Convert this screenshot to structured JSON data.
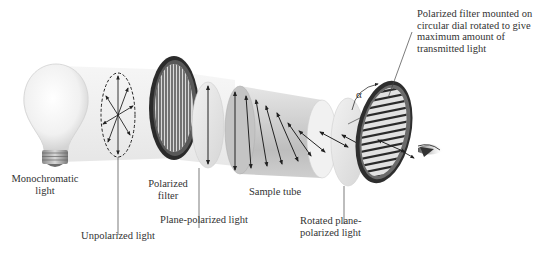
{
  "diagram": {
    "components": [
      {
        "id": "bulb",
        "label": "Monochromatic\nlight"
      },
      {
        "id": "unpolarized",
        "label": "Unpolarized light"
      },
      {
        "id": "polarizer",
        "label": "Polarized\nfilter"
      },
      {
        "id": "plane",
        "label": "Plane-polarized light"
      },
      {
        "id": "tube",
        "label": "Sample tube"
      },
      {
        "id": "rotated",
        "label": "Rotated plane-\npolarized light"
      },
      {
        "id": "analyzer",
        "label": "Polarized filter mounted on\ncircular dial rotated to give\nmaximum amount of\ntransmitted light"
      }
    ],
    "angle_symbol": "α"
  },
  "labels": {
    "monochromatic_line1": "Monochromatic",
    "monochromatic_line2": "light",
    "unpolarized": "Unpolarized light",
    "polarized_line1": "Polarized",
    "polarized_line2": "filter",
    "plane_polarized": "Plane-polarized light",
    "sample_tube": "Sample tube",
    "rotated_line1": "Rotated plane-",
    "rotated_line2": "polarized light",
    "analyzer_line1": "Polarized filter mounted on",
    "analyzer_line2": "circular dial rotated to give",
    "analyzer_line3": "maximum amount of",
    "analyzer_line4": "transmitted light",
    "alpha": "α"
  }
}
